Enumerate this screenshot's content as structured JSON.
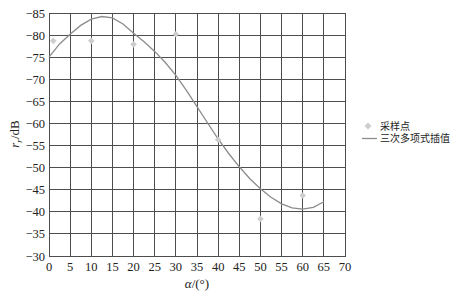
{
  "chart_data": {
    "type": "line",
    "title": "",
    "xlabel": "α/(°)",
    "ylabel": "r_r/dB",
    "xlim": [
      0,
      70
    ],
    "ylim": [
      -85,
      -30
    ],
    "y_axis_inverted_top": -85,
    "xticks": [
      0,
      5,
      10,
      15,
      20,
      25,
      30,
      35,
      40,
      45,
      50,
      55,
      60,
      65,
      70
    ],
    "xtick_labels": [
      "0",
      "5",
      "10",
      "15",
      "20",
      "25",
      "30",
      "35",
      "40",
      "45",
      "50",
      "55",
      "60",
      "65",
      "70"
    ],
    "yticks": [
      -85,
      -80,
      -75,
      -70,
      -65,
      -60,
      -55,
      -50,
      -45,
      -40,
      -35,
      -30
    ],
    "ytick_labels": [
      "−85",
      "−80",
      "−75",
      "−70",
      "−65",
      "−60",
      "−55",
      "−50",
      "−45",
      "−40",
      "−35",
      "−30"
    ],
    "grid": true,
    "legend_position": "right",
    "series": [
      {
        "name": "采样点",
        "type": "scatter",
        "marker": "diamond",
        "color": "#cdcdcd",
        "x": [
          1,
          10,
          20,
          30,
          40,
          50,
          60
        ],
        "y": [
          -78.7,
          -78.7,
          -77.9,
          -80.2,
          -56.3,
          -38.4,
          -43.7
        ]
      },
      {
        "name": "三次多项式插值",
        "type": "line",
        "color": "#8c8c8c",
        "x": [
          0,
          2.5,
          5,
          7.5,
          10,
          12.5,
          15,
          17.5,
          20,
          22.5,
          25,
          27.5,
          30,
          32.5,
          35,
          37.5,
          40,
          42.5,
          45,
          47.5,
          50,
          52.5,
          55,
          57.5,
          60,
          62.5,
          65
        ],
        "y": [
          -75.0,
          -78.0,
          -80.2,
          -82.2,
          -83.6,
          -84.2,
          -83.9,
          -82.5,
          -80.4,
          -78.5,
          -76.3,
          -73.8,
          -70.9,
          -67.5,
          -63.8,
          -60.1,
          -56.5,
          -53.2,
          -50.2,
          -47.5,
          -45.2,
          -43.3,
          -41.8,
          -40.9,
          -40.6,
          -41.0,
          -42.3
        ]
      }
    ]
  },
  "axes": {
    "ylabel_main": "r",
    "ylabel_sub": "r",
    "ylabel_unit": "/dB",
    "xlabel_symbol": "α",
    "xlabel_unit": "/(°)"
  },
  "legend": {
    "items": [
      {
        "label": "采样点",
        "symbol": "diamond-marker"
      },
      {
        "label": "三次多项式插值",
        "symbol": "line-swatch"
      }
    ]
  }
}
